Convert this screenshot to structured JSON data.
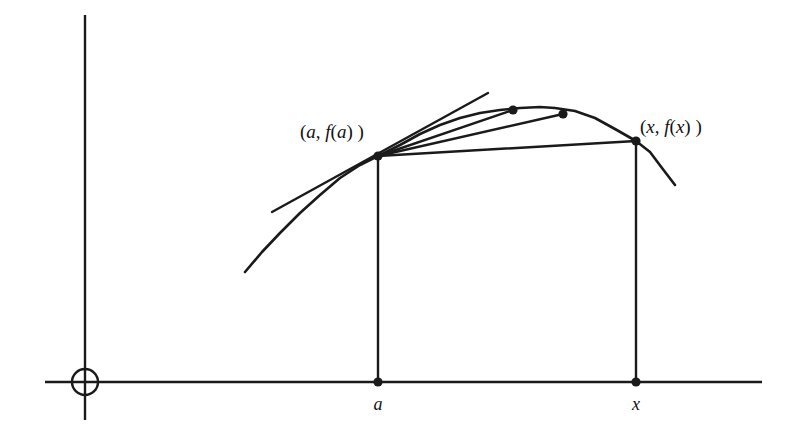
{
  "figure": {
    "background_color": "#ffffff",
    "ink_color": "#1a1a1a",
    "width": 795,
    "height": 438
  },
  "axes": {
    "origin_symbol": "circle",
    "x_axis": {
      "name": "x-axis",
      "y": 382,
      "x_start": 45,
      "x_end": 762
    },
    "y_axis": {
      "name": "y-axis",
      "x": 85,
      "y_start": 15,
      "y_end": 420
    },
    "origin": {
      "x": 85,
      "y": 382,
      "radius": 13
    },
    "ticks": [
      {
        "label": "a",
        "x": 378,
        "y": 382,
        "label_x": 378,
        "label_y": 410
      },
      {
        "label": "x",
        "x": 636,
        "y": 382,
        "label_x": 636,
        "label_y": 410
      }
    ]
  },
  "labels": [
    {
      "name": "point-a-label",
      "text": "(a, f(a))",
      "parts": [
        {
          "t": "(",
          "italic": false
        },
        {
          "t": "a",
          "italic": true
        },
        {
          "t": ", ",
          "italic": false
        },
        {
          "t": "f",
          "italic": true
        },
        {
          "t": "(",
          "italic": false
        },
        {
          "t": "a",
          "italic": true
        },
        {
          "t": ") )",
          "italic": false
        }
      ],
      "x": 300,
      "y": 138,
      "anchor": "start"
    },
    {
      "name": "point-x-label",
      "text": "(x, f(x))",
      "parts": [
        {
          "t": "(",
          "italic": false
        },
        {
          "t": "x",
          "italic": true
        },
        {
          "t": ", ",
          "italic": false
        },
        {
          "t": "f",
          "italic": true
        },
        {
          "t": "(",
          "italic": false
        },
        {
          "t": "x",
          "italic": true
        },
        {
          "t": ") )",
          "italic": false
        }
      ],
      "x": 640,
      "y": 133,
      "anchor": "start"
    }
  ],
  "chart_data": {
    "type": "line",
    "xlabel": "",
    "ylabel": "",
    "grid": false,
    "legend": null,
    "xlim": [
      85,
      762
    ],
    "ylim": [
      382,
      15
    ],
    "note": "Pixel coordinates; y increases downward in screen space.",
    "series": [
      {
        "name": "function-curve",
        "type": "curve",
        "points": [
          [
            245,
            272
          ],
          [
            262,
            252
          ],
          [
            280,
            233
          ],
          [
            300,
            213
          ],
          [
            320,
            195
          ],
          [
            340,
            178
          ],
          [
            360,
            165
          ],
          [
            378,
            156
          ],
          [
            400,
            145
          ],
          [
            420,
            134
          ],
          [
            440,
            125
          ],
          [
            460,
            118
          ],
          [
            480,
            113
          ],
          [
            500,
            110
          ],
          [
            520,
            108
          ],
          [
            540,
            107
          ],
          [
            555,
            108
          ],
          [
            575,
            111
          ],
          [
            595,
            118
          ],
          [
            615,
            129
          ],
          [
            636,
            141
          ],
          [
            650,
            152
          ],
          [
            662,
            168
          ],
          [
            675,
            185
          ]
        ]
      },
      {
        "name": "tangent-line",
        "type": "line",
        "from": [
          272,
          212
        ],
        "to": [
          488,
          93
        ],
        "through": [
          378,
          156
        ]
      },
      {
        "name": "secant-line-1",
        "type": "line",
        "from": [
          378,
          156
        ],
        "to": [
          513,
          110
        ],
        "endpoint_marked": true
      },
      {
        "name": "secant-line-2",
        "type": "line",
        "from": [
          378,
          156
        ],
        "to": [
          563,
          114
        ],
        "endpoint_marked": true
      },
      {
        "name": "secant-line-3",
        "type": "line",
        "from": [
          378,
          156
        ],
        "to": [
          636,
          141
        ],
        "endpoint_marked": true
      },
      {
        "name": "vertical-drop-a",
        "type": "line",
        "from": [
          378,
          156
        ],
        "to": [
          378,
          382
        ]
      },
      {
        "name": "vertical-drop-x",
        "type": "line",
        "from": [
          636,
          141
        ],
        "to": [
          636,
          382
        ]
      }
    ],
    "marked_points": [
      {
        "name": "point-a",
        "x": 378,
        "y": 156,
        "label": "(a, f(a))"
      },
      {
        "name": "secant-point-1",
        "x": 513,
        "y": 110,
        "label": ""
      },
      {
        "name": "secant-point-2",
        "x": 563,
        "y": 114,
        "label": ""
      },
      {
        "name": "point-x",
        "x": 636,
        "y": 141,
        "label": "(x, f(x))"
      },
      {
        "name": "axis-point-a",
        "x": 378,
        "y": 382,
        "label": "a"
      },
      {
        "name": "axis-point-x",
        "x": 636,
        "y": 382,
        "label": "x"
      }
    ]
  }
}
